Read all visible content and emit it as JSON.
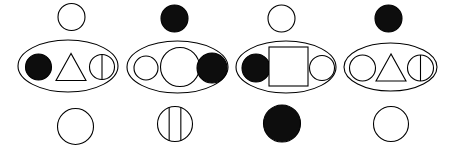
{
  "figure": {
    "canvas": {
      "width": 459,
      "height": 151,
      "background": "#ffffff"
    },
    "style": {
      "stroke": "#000000",
      "fill_white": "#ffffff",
      "fill_black": "#0d0d0d",
      "stroke_width": 1.1
    },
    "groups": [
      {
        "id": "group-1",
        "top": {
          "shape": "circle",
          "fill": "white",
          "cx": 71.5,
          "cy": 17.0,
          "r": 13.5
        },
        "container": {
          "shape": "ellipse",
          "fill": "white",
          "cx": 68.0,
          "cy": 66.0,
          "rx": 50.0,
          "ry": 26.0
        },
        "contents": [
          {
            "shape": "circle",
            "fill": "black",
            "cx": 38.5,
            "cy": 67.0,
            "r": 13.0
          },
          {
            "shape": "triangle",
            "fill": "white",
            "cx": 71.0,
            "cy": 67.0,
            "w": 30.0,
            "h": 27.0
          },
          {
            "shape": "circle-split-2",
            "fill": "white",
            "cx": 102.0,
            "cy": 67.0,
            "r": 12.5,
            "dividers": 1
          }
        ],
        "bottom": {
          "shape": "circle",
          "fill": "white",
          "cx": 75.5,
          "cy": 126.5,
          "r": 18.0
        }
      },
      {
        "id": "group-2",
        "top": {
          "shape": "circle",
          "fill": "black",
          "cx": 174.5,
          "cy": 18.5,
          "r": 13.5
        },
        "container": {
          "shape": "ellipse",
          "fill": "white",
          "cx": 177.5,
          "cy": 67.0,
          "rx": 50.5,
          "ry": 26.0
        },
        "contents": [
          {
            "shape": "circle",
            "fill": "white",
            "cx": 146.0,
            "cy": 68.0,
            "r": 12.0
          },
          {
            "shape": "circle",
            "fill": "white",
            "cx": 180.0,
            "cy": 67.0,
            "r": 19.5
          },
          {
            "shape": "circle",
            "fill": "black",
            "cx": 212.0,
            "cy": 68.0,
            "r": 15.0
          }
        ],
        "bottom": {
          "shape": "circle-split-3",
          "fill": "white",
          "cx": 175.0,
          "cy": 124.0,
          "r": 17.5,
          "dividers": 2
        }
      },
      {
        "id": "group-3",
        "top": {
          "shape": "circle",
          "fill": "white",
          "cx": 281.5,
          "cy": 18.5,
          "r": 13.5
        },
        "container": {
          "shape": "ellipse",
          "fill": "white",
          "cx": 286.0,
          "cy": 67.0,
          "rx": 50.0,
          "ry": 26.0
        },
        "contents": [
          {
            "shape": "circle",
            "fill": "black",
            "cx": 256.0,
            "cy": 68.0,
            "r": 14.0
          },
          {
            "shape": "square",
            "fill": "white",
            "cx": 288.5,
            "cy": 66.5,
            "size": 39.0
          },
          {
            "shape": "circle",
            "fill": "white",
            "cx": 322.0,
            "cy": 68.0,
            "r": 12.5
          }
        ],
        "bottom": {
          "shape": "circle",
          "fill": "black",
          "cx": 282.0,
          "cy": 123.5,
          "r": 18.5
        }
      },
      {
        "id": "group-4",
        "top": {
          "shape": "circle",
          "fill": "black",
          "cx": 388.5,
          "cy": 18.5,
          "r": 13.5
        },
        "container": {
          "shape": "ellipse",
          "fill": "white",
          "cx": 390.5,
          "cy": 67.0,
          "rx": 46.5,
          "ry": 24.0
        },
        "contents": [
          {
            "shape": "circle",
            "fill": "white",
            "cx": 362.5,
            "cy": 68.0,
            "r": 13.0
          },
          {
            "shape": "triangle",
            "fill": "white",
            "cx": 391.0,
            "cy": 67.5,
            "w": 30.0,
            "h": 27.0
          },
          {
            "shape": "circle-split-2",
            "fill": "white",
            "cx": 420.5,
            "cy": 68.0,
            "r": 13.0,
            "dividers": 1
          }
        ],
        "bottom": {
          "shape": "circle",
          "fill": "white",
          "cx": 391.0,
          "cy": 124.0,
          "r": 17.5
        }
      }
    ]
  }
}
